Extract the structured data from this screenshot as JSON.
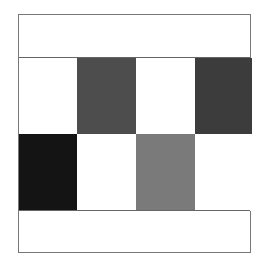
{
  "diagram": {
    "type": "grid-pattern",
    "rows": 2,
    "columns": 4,
    "cells": [
      {
        "row": 0,
        "col": 0,
        "color": "#ffffff",
        "shade": "white"
      },
      {
        "row": 0,
        "col": 1,
        "color": "#4d4d4d",
        "shade": "dark-gray"
      },
      {
        "row": 0,
        "col": 2,
        "color": "#ffffff",
        "shade": "white"
      },
      {
        "row": 0,
        "col": 3,
        "color": "#3c3c3c",
        "shade": "darker-gray"
      },
      {
        "row": 1,
        "col": 0,
        "color": "#141414",
        "shade": "black"
      },
      {
        "row": 1,
        "col": 1,
        "color": "#ffffff",
        "shade": "white"
      },
      {
        "row": 1,
        "col": 2,
        "color": "#7a7a7a",
        "shade": "medium-gray"
      },
      {
        "row": 1,
        "col": 3,
        "color": "#ffffff",
        "shade": "white"
      }
    ]
  }
}
